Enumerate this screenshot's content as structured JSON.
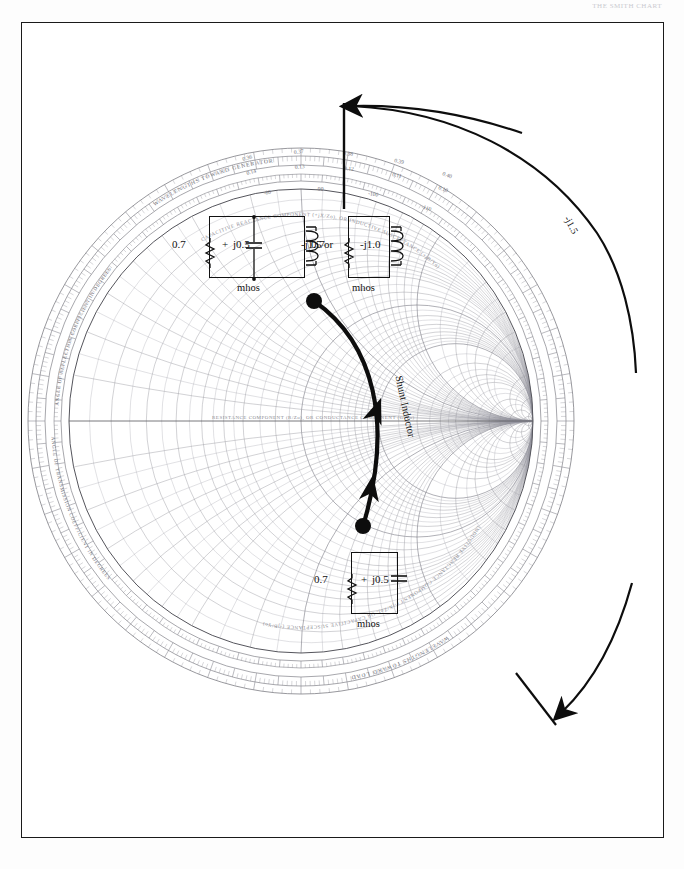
{
  "page": {
    "header_text": "THE SMITH CHART",
    "background": "#ffffff",
    "frame_color": "#1a1a1a"
  },
  "chart_data": {
    "type": "scatter",
    "chart_kind": "smith-admittance-chart",
    "center": [
      300,
      420
    ],
    "radius": 252,
    "axis_labels": {
      "horizontal_center": "RESISTANCE COMPONENT (R/Zo), OR CONDUCTANCE COMPONENT (G/Yo)",
      "upper_arc": "CAPACITIVE REACTANCE COMPONENT (+jX/Zo), OR INDUCTIVE SUSCEPTANCE (+jB/Yo)",
      "lower_arc": "INDUCTIVE REACTANCE COMPONENT (-jX/Zo), OR CAPACITIVE SUSCEPTANCE (-jB/Yo)",
      "outer_left_1": "ANGLE OF REFLECTION COEFFICIENT IN DEGREES",
      "outer_left_2": "ANGLE OF TRANSMISSION COEFFICIENT IN DEGREES",
      "outer_ring_top": "WAVELENGTHS TOWARD GENERATOR",
      "outer_ring_bottom": "WAVELENGTHS TOWARD LOAD"
    },
    "resistance_circles": [
      0.1,
      0.2,
      0.3,
      0.4,
      0.5,
      0.6,
      0.8,
      1.0,
      1.2,
      1.4,
      1.6,
      1.8,
      2.0,
      3.0,
      4.0,
      5.0,
      10.0,
      20.0,
      50.0
    ],
    "reactance_arcs": [
      0.1,
      0.2,
      0.3,
      0.4,
      0.5,
      0.6,
      0.8,
      1.0,
      1.2,
      1.4,
      1.6,
      1.8,
      2.0,
      3.0,
      4.0,
      5.0,
      10.0,
      20.0,
      50.0
    ],
    "wavelength_scale_top": [
      "0.36",
      "0.37",
      "0.38",
      "0.39",
      "0.40"
    ],
    "wavelength_scale_top_inner": [
      "0.14",
      "0.13",
      "0.12",
      "0.11",
      "0.10"
    ],
    "angle_scale_top": [
      "-80",
      "-90",
      "-100",
      "-110"
    ],
    "points": [
      {
        "name": "start-point",
        "label": "0.7 + j0.5 mhos",
        "x": 313,
        "y": 300,
        "admittance_real": 0.7,
        "admittance_imag": 0.5
      },
      {
        "name": "end-point",
        "label": "0.7 + j0.5 mhos",
        "x": 362,
        "y": 525,
        "admittance_real": 0.7,
        "admittance_imag": 0.5
      }
    ],
    "locus": {
      "name": "constant-conductance-arc",
      "description": "movement along constant conductance g=0.7 circle from +j0.5 to -j1.0",
      "direction": "upward",
      "annotation": "Shunt Inductor"
    },
    "outer_arc_annotation": "-j1.5"
  },
  "circuits": {
    "top_left": {
      "name": "parallel-rlc-left",
      "resistor_value": "0.7",
      "plus_sign": "+",
      "capacitor_value": "j0.5",
      "inductor_value": "-j1.5",
      "units": "mhos"
    },
    "top_right": {
      "name": "parallel-rl-right",
      "resistor_value": "0.7",
      "inductor_value": "-j1.0",
      "units": "mhos"
    },
    "bottom": {
      "name": "parallel-rc-bottom",
      "resistor_value": "0.7",
      "plus_sign": "+",
      "capacitor_value": "j0.5",
      "units": "mhos"
    },
    "or_separator": "or"
  },
  "annotations": {
    "shunt_inductor": "Shunt Inductor",
    "outer_susceptance": "-j1.5"
  }
}
